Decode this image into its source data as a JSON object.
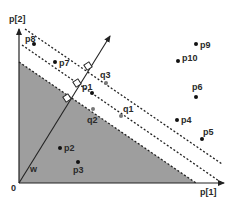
{
  "diagram": {
    "axes": {
      "x_label": "p[1]",
      "y_label": "p[2]",
      "origin_label": "0"
    },
    "vector": {
      "label": "w"
    },
    "colors": {
      "shaded_region": "#9e9e9e",
      "line": "#222222",
      "point": "#111111",
      "query_point": "#777777",
      "background": "#ffffff"
    },
    "points": [
      {
        "label": "p1",
        "x": 92,
        "y": 93,
        "type": "data"
      },
      {
        "label": "p2",
        "x": 60,
        "y": 148,
        "type": "data"
      },
      {
        "label": "p3",
        "x": 78,
        "y": 162,
        "type": "data"
      },
      {
        "label": "p4",
        "x": 177,
        "y": 120,
        "type": "data"
      },
      {
        "label": "p5",
        "x": 202,
        "y": 139,
        "type": "data"
      },
      {
        "label": "p6",
        "x": 196,
        "y": 97,
        "type": "data"
      },
      {
        "label": "p7",
        "x": 55,
        "y": 62,
        "type": "data"
      },
      {
        "label": "p8",
        "x": 34,
        "y": 44,
        "type": "data"
      },
      {
        "label": "p9",
        "x": 196,
        "y": 44,
        "type": "data"
      },
      {
        "label": "p10",
        "x": 178,
        "y": 61,
        "type": "data"
      },
      {
        "label": "q1",
        "x": 121,
        "y": 116,
        "type": "query"
      },
      {
        "label": "q2",
        "x": 93,
        "y": 109,
        "type": "query"
      },
      {
        "label": "q3",
        "x": 106,
        "y": 83,
        "type": "query"
      }
    ]
  }
}
